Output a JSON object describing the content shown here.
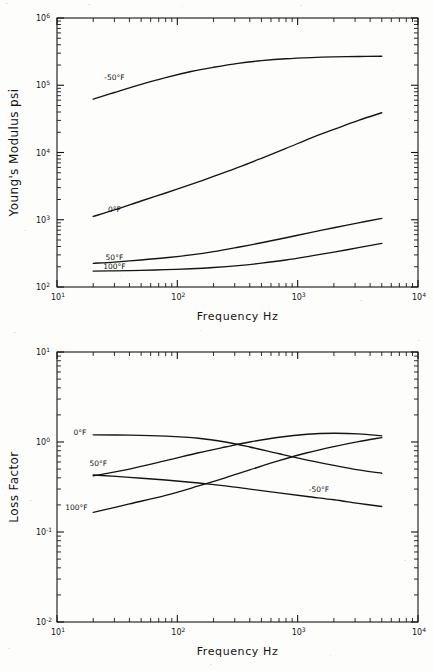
{
  "document": {
    "kind": "two-panel-log-log-figure",
    "ink_color": "#141414",
    "paper_color": "#fdfdfc"
  },
  "chart_data": [
    {
      "id": "youngs-modulus",
      "type": "line",
      "title": "",
      "xlabel": "Frequency Hz",
      "ylabel": "Young's Modulus psi",
      "xscale": "log",
      "yscale": "log",
      "xlim": [
        10,
        10000
      ],
      "ylim": [
        100,
        1000000
      ],
      "grid": false,
      "legend_position": "inline-curve-labels",
      "xticklabels": [
        "10¹",
        "10²",
        "10³",
        "10⁴"
      ],
      "xtickvalues": [
        10,
        100,
        1000,
        10000
      ],
      "yticklabels": [
        "10²",
        "10³",
        "10⁴",
        "10⁵",
        "10⁶"
      ],
      "ytickvalues": [
        100,
        1000,
        10000,
        100000,
        1000000
      ],
      "series": [
        {
          "name": "-50°F",
          "label": "-50°F",
          "label_x": 30,
          "label_y": 130000,
          "x": [
            20,
            30,
            50,
            80,
            130,
            200,
            320,
            500,
            800,
            1300,
            2000,
            3200,
            5000
          ],
          "y": [
            62000,
            78000,
            103000,
            130000,
            160000,
            185000,
            212000,
            232000,
            248000,
            258000,
            264000,
            268000,
            270000
          ]
        },
        {
          "name": "0°F",
          "label": "0°F",
          "label_x": 30,
          "label_y": 1400,
          "x": [
            20,
            30,
            50,
            80,
            130,
            200,
            320,
            500,
            800,
            1300,
            2000,
            3200,
            5000
          ],
          "y": [
            1120,
            1400,
            1900,
            2500,
            3350,
            4400,
            6000,
            8200,
            11500,
            16500,
            22000,
            30000,
            39000
          ]
        },
        {
          "name": "50°F",
          "label": "50°F",
          "label_x": 30,
          "label_y": 270,
          "x": [
            20,
            30,
            50,
            80,
            130,
            200,
            320,
            500,
            800,
            1300,
            2000,
            3200,
            5000
          ],
          "y": [
            225,
            235,
            252,
            272,
            300,
            335,
            390,
            455,
            540,
            650,
            760,
            900,
            1050
          ]
        },
        {
          "name": "100°F",
          "label": "100°F",
          "label_x": 30,
          "label_y": 205,
          "x": [
            20,
            30,
            50,
            80,
            130,
            200,
            320,
            500,
            800,
            1300,
            2000,
            3200,
            5000
          ],
          "y": [
            172,
            174,
            177,
            181,
            187,
            195,
            208,
            226,
            252,
            290,
            330,
            385,
            445
          ]
        }
      ]
    },
    {
      "id": "loss-factor",
      "type": "line",
      "title": "",
      "xlabel": "Frequency Hz",
      "ylabel": "Loss Factor",
      "xscale": "log",
      "yscale": "log",
      "xlim": [
        10,
        10000
      ],
      "ylim": [
        0.01,
        10
      ],
      "grid": false,
      "legend_position": "inline-curve-labels",
      "xticklabels": [
        "10¹",
        "10²",
        "10³",
        "10⁴"
      ],
      "xtickvalues": [
        10,
        100,
        1000,
        10000
      ],
      "yticklabels": [
        "10⁻²",
        "10⁻¹",
        "10⁰",
        "10¹"
      ],
      "ytickvalues": [
        0.01,
        0.1,
        1,
        10
      ],
      "series": [
        {
          "name": "0°F",
          "label": "0°F",
          "label_x": 15.5,
          "label_y": 1.28,
          "x": [
            20,
            40,
            80,
            150,
            250,
            400,
            700,
            1200,
            2000,
            3200,
            5000
          ],
          "y": [
            1.2,
            1.19,
            1.16,
            1.1,
            1.0,
            0.88,
            0.74,
            0.63,
            0.55,
            0.49,
            0.45
          ]
        },
        {
          "name": "50°F",
          "label": "50°F",
          "label_x": 22,
          "label_y": 0.58,
          "x": [
            20,
            40,
            80,
            150,
            250,
            400,
            700,
            1200,
            2000,
            3200,
            5000
          ],
          "y": [
            0.42,
            0.5,
            0.62,
            0.76,
            0.88,
            1.0,
            1.13,
            1.22,
            1.25,
            1.23,
            1.17
          ]
        },
        {
          "name": "100°F",
          "label": "100°F",
          "label_x": 14.5,
          "label_y": 0.185,
          "x": [
            20,
            40,
            80,
            150,
            250,
            400,
            700,
            1200,
            2000,
            3200,
            5000
          ],
          "y": [
            0.165,
            0.205,
            0.255,
            0.325,
            0.4,
            0.49,
            0.62,
            0.76,
            0.89,
            1.01,
            1.12
          ]
        },
        {
          "name": "-50°F",
          "label": "-50°F",
          "label_x": 1500,
          "label_y": 0.295,
          "x": [
            20,
            40,
            80,
            150,
            250,
            400,
            700,
            1200,
            2000,
            3200,
            5000
          ],
          "y": [
            0.43,
            0.405,
            0.378,
            0.35,
            0.325,
            0.3,
            0.272,
            0.248,
            0.228,
            0.208,
            0.192
          ]
        }
      ]
    }
  ]
}
